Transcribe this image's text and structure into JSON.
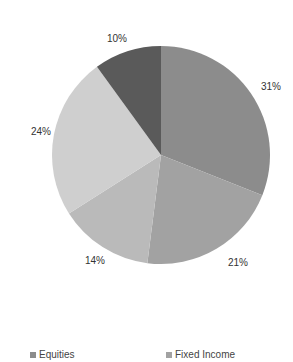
{
  "chart_data": {
    "type": "pie",
    "title": "",
    "start_angle_deg": 0,
    "direction": "clockwise",
    "slices": [
      {
        "name": "Equities",
        "value": 31,
        "label": "31%",
        "color": "#8c8c8c"
      },
      {
        "name": "Fixed Income",
        "value": 21,
        "label": "21%",
        "color": "#a2a2a2"
      },
      {
        "name": "",
        "value": 14,
        "label": "14%",
        "color": "#bababa"
      },
      {
        "name": "",
        "value": 24,
        "label": "24%",
        "color": "#cfcfcf"
      },
      {
        "name": "",
        "value": 10,
        "label": "10%",
        "color": "#5a5a5a"
      }
    ],
    "legend": {
      "position": "bottom",
      "entries": [
        {
          "label": "Equities",
          "color": "#8c8c8c"
        },
        {
          "label": "Fixed Income",
          "color": "#a2a2a2"
        }
      ]
    }
  },
  "layout": {
    "center": [
      161,
      155
    ],
    "radius": 109,
    "label_positions": [
      [
        271,
        86
      ],
      [
        238,
        262
      ],
      [
        95,
        260
      ],
      [
        41,
        131
      ],
      [
        117,
        38
      ]
    ]
  },
  "legend": {
    "items": [
      {
        "label": "Equities",
        "color": "#8c8c8c",
        "x": 30
      },
      {
        "label": "Fixed Income",
        "color": "#a2a2a2",
        "x": 166
      }
    ]
  }
}
